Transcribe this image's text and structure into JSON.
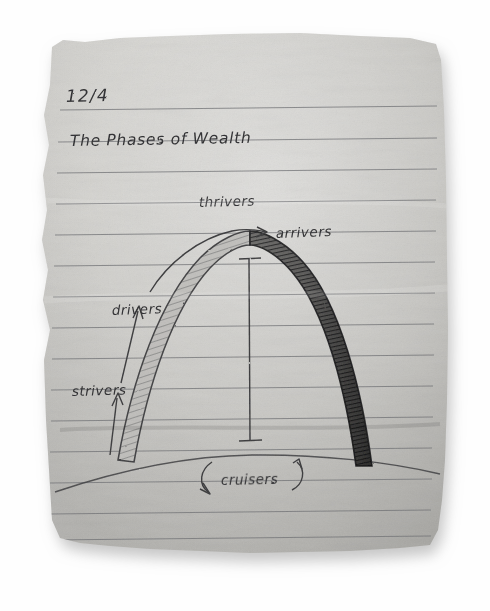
{
  "medium": {
    "surface": "lined-notebook-paper",
    "tool": "pencil",
    "paper_color": "#c9c8c4",
    "paper_shadow_color": "#bdbdbd",
    "rule_line_color": "#6f7074",
    "pencil_color": "#3a3a3c",
    "background_color": "#fefefe"
  },
  "note": {
    "date": "12/4",
    "title": "The Phases of Wealth"
  },
  "diagram": {
    "shape": "gateway-arch",
    "ground_label": "ground-hill-curve",
    "center_measure_label": "height-measure-line",
    "labels": {
      "top": "thrivers",
      "apex_right": "arrivers",
      "upper_left": "drivers",
      "lower_left": "strivers",
      "bottom_center": "cruisers"
    },
    "arrows": {
      "arrivers": "curved-arrow-right",
      "drivers": "straight-arrow-up",
      "strivers": "straight-arrow-up",
      "cruisers_left": "curved-arrow-down-left",
      "cruisers_right": "curved-arrow-up-right"
    }
  },
  "ruled_lines": {
    "count": 15,
    "spacing_px": 31
  }
}
